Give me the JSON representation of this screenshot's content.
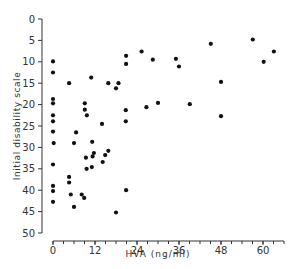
{
  "chart_data": {
    "type": "scatter",
    "title": "",
    "xlabel": "HVA (ng/ml)",
    "ylabel": "Initial disability scale",
    "xlim": [
      0,
      66
    ],
    "ylim": [
      0,
      50
    ],
    "y_inverted": true,
    "x_ticks": [
      0,
      12,
      24,
      36,
      48,
      60
    ],
    "x_minor_step": 3,
    "y_ticks": [
      0,
      5,
      10,
      15,
      20,
      25,
      30,
      35,
      40,
      45,
      50
    ],
    "grid": false,
    "legend": null,
    "marker_color": "#111111",
    "points": [
      [
        0,
        9.9
      ],
      [
        0,
        12.5
      ],
      [
        0,
        18.7
      ],
      [
        0,
        19.7
      ],
      [
        0,
        22.5
      ],
      [
        0,
        23.9
      ],
      [
        0,
        26.3
      ],
      [
        0.2,
        29.0
      ],
      [
        0,
        34.0
      ],
      [
        0,
        39.0
      ],
      [
        0,
        40.2
      ],
      [
        0,
        42.7
      ],
      [
        4.6,
        15.0
      ],
      [
        10.9,
        13.7
      ],
      [
        15.8,
        15.0
      ],
      [
        18.7,
        15.0
      ],
      [
        18.0,
        16.2
      ],
      [
        9.1,
        19.7
      ],
      [
        9.1,
        21.2
      ],
      [
        9.7,
        22.5
      ],
      [
        14.0,
        24.5
      ],
      [
        6.6,
        26.5
      ],
      [
        6.0,
        29.0
      ],
      [
        11.2,
        28.7
      ],
      [
        11.7,
        31.3
      ],
      [
        15.8,
        30.8
      ],
      [
        9.4,
        32.4
      ],
      [
        11.3,
        32.1
      ],
      [
        14.9,
        31.8
      ],
      [
        14.2,
        33.4
      ],
      [
        11.1,
        34.6
      ],
      [
        9.6,
        35.0
      ],
      [
        4.6,
        36.9
      ],
      [
        4.6,
        38.2
      ],
      [
        5.1,
        41.0
      ],
      [
        8.2,
        41.0
      ],
      [
        8.9,
        41.8
      ],
      [
        6.0,
        43.9
      ],
      [
        18.0,
        45.2
      ],
      [
        20.9,
        8.6
      ],
      [
        25.3,
        7.6
      ],
      [
        20.9,
        10.5
      ],
      [
        28.5,
        9.5
      ],
      [
        35.1,
        9.3
      ],
      [
        36.0,
        11.1
      ],
      [
        30.0,
        19.6
      ],
      [
        26.7,
        20.6
      ],
      [
        20.8,
        21.3
      ],
      [
        39.1,
        19.9
      ],
      [
        20.8,
        23.9
      ],
      [
        20.9,
        40.0
      ],
      [
        45.1,
        5.8
      ],
      [
        57.1,
        4.8
      ],
      [
        63.1,
        7.6
      ],
      [
        60.2,
        10.0
      ],
      [
        48.0,
        14.7
      ],
      [
        48.0,
        22.7
      ]
    ]
  }
}
